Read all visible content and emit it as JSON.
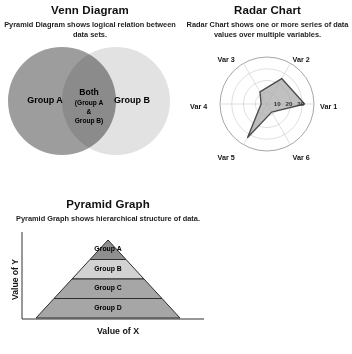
{
  "venn": {
    "title": "Venn Diagram",
    "subtitle": "Pyramid Diagram shows logical relation between data sets.",
    "group_a_label": "Group A",
    "group_b_label": "Group B",
    "overlap_title": "Both",
    "overlap_detail_line1": "(Group A",
    "overlap_detail_line2": "&",
    "overlap_detail_line3": "Group B)",
    "color_a": "#9d9d9d",
    "color_b": "#e2e2e2"
  },
  "radar": {
    "title": "Radar Chart",
    "subtitle": "Radar Chart shows one or more series of data values over multiple variables."
  },
  "pyramid": {
    "title": "Pyramid Graph",
    "subtitle": "Pyramid Graph shows hierarchical structure of data.",
    "ylabel": "Value of Y",
    "xlabel": "Value of X"
  },
  "chart_data": [
    {
      "type": "pie",
      "subtype": "venn",
      "title": "Venn Diagram",
      "sets": [
        {
          "name": "Group A",
          "fill": "#9d9d9d"
        },
        {
          "name": "Group B",
          "fill": "#e2e2e2"
        }
      ],
      "intersection": {
        "name": "Both",
        "members": [
          "Group A",
          "Group B"
        ],
        "fill": "#8a8a8a"
      }
    },
    {
      "type": "line",
      "subtype": "radar",
      "title": "Radar Chart",
      "categories": [
        "Var 1",
        "Var 2",
        "Var 3",
        "Var 4",
        "Var 5",
        "Var 6"
      ],
      "series": [
        {
          "name": "Series 1",
          "values": [
            32,
            25,
            12,
            5,
            33,
            8
          ],
          "fill": "#a8a8a8",
          "stroke": "#4d4d4d"
        }
      ],
      "rlim": [
        0,
        40
      ],
      "tick_labels": [
        "10",
        "20",
        "30"
      ],
      "ticks": [
        10,
        20,
        30
      ],
      "grid": true,
      "legend": "none"
    },
    {
      "type": "bar",
      "subtype": "pyramid",
      "title": "Pyramid Graph",
      "xlabel": "Value of X",
      "ylabel": "Value of Y",
      "categories": [
        "Group A",
        "Group B",
        "Group C",
        "Group D"
      ],
      "values": [
        1,
        2,
        3,
        4
      ],
      "layers": [
        {
          "label": "Group A",
          "fill": "#8f8f8f"
        },
        {
          "label": "Group B",
          "fill": "#d2d2d2"
        },
        {
          "label": "Group C",
          "fill": "#a6a6a6"
        },
        {
          "label": "Group D",
          "fill": "#a6a6a6"
        }
      ],
      "grid": false,
      "legend": "none"
    }
  ]
}
